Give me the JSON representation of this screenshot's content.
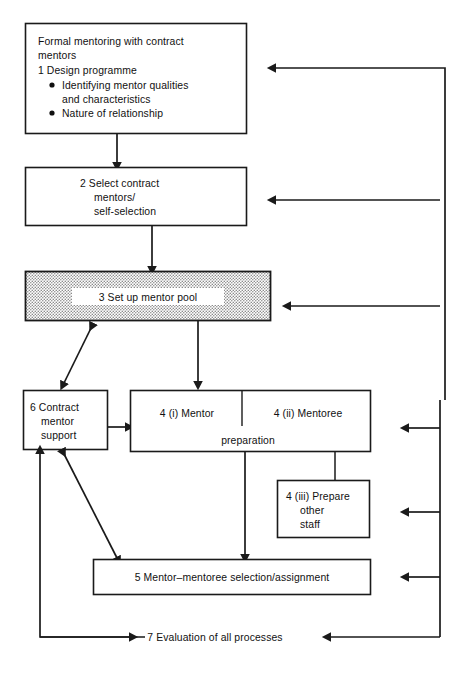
{
  "diagram": {
    "type": "flowchart",
    "title": "Formal mentoring with contract mentors",
    "orientation": "top-to-bottom with feedback loops",
    "background_color": "#ffffff",
    "line_color": "#1a1a1a",
    "shaded_fill_color": "#c9c9c9",
    "nodes": {
      "box1": {
        "number": "1",
        "heading_line1": "Formal mentoring with contract",
        "heading_line2": "mentors",
        "step_label": "1  Design programme",
        "bullets": [
          {
            "line1": "Identifying mentor qualities",
            "line2": "and characteristics"
          },
          {
            "line1": "Nature of relationship",
            "line2": ""
          }
        ]
      },
      "box2": {
        "number": "2",
        "line1": "2  Select contract",
        "line2": "mentors/",
        "line3": "self-selection"
      },
      "box3": {
        "number": "3",
        "label": "3  Set up mentor pool",
        "shaded": true
      },
      "box4": {
        "left_label": "4  (i) Mentor",
        "right_label": "4  (ii) Mentoree",
        "shared_label": "preparation"
      },
      "box4iii": {
        "line1": "4  (iii) Prepare",
        "line2": "other",
        "line3": "staff"
      },
      "box5": {
        "number": "5",
        "label": "5  Mentor–mentoree selection/assignment"
      },
      "box6": {
        "number": "6",
        "line1": "6  Contract",
        "line2": "mentor",
        "line3": "support"
      },
      "item7": {
        "number": "7",
        "label": "7  Evaluation of all processes",
        "boxed": false
      }
    },
    "connectors": [
      {
        "from": "box1",
        "to": "box2",
        "style": "straight-down-arrow"
      },
      {
        "from": "box2",
        "to": "box3",
        "style": "straight-down-arrow"
      },
      {
        "from": "box3",
        "to": "box4",
        "style": "straight-down-arrow"
      },
      {
        "from": "box3",
        "to": "box6",
        "style": "double-headed-diagonal"
      },
      {
        "from": "box6",
        "to": "box4",
        "style": "right-arrow"
      },
      {
        "from": "box6",
        "to": "box5",
        "style": "double-headed-diagonal"
      },
      {
        "from": "box4",
        "to": "box5",
        "style": "straight-down-arrow"
      },
      {
        "from": "box4",
        "to": "box4iii",
        "style": "elbow-down"
      },
      {
        "from": "item7",
        "to": "box1",
        "style": "outer-feedback-rail-arrow"
      },
      {
        "from": "item7",
        "to": "box2",
        "style": "outer-feedback-rail-arrow"
      },
      {
        "from": "item7",
        "to": "box3",
        "style": "outer-feedback-rail-arrow"
      },
      {
        "from": "item7",
        "to": "box4",
        "style": "inner-feedback-rail-arrow"
      },
      {
        "from": "item7",
        "to": "box4iii",
        "style": "inner-feedback-rail-arrow"
      },
      {
        "from": "item7",
        "to": "box5",
        "style": "inner-feedback-rail-arrow"
      },
      {
        "from": "box6",
        "to": "item7",
        "style": "left-rail-elbow-arrow"
      },
      {
        "from": "rails",
        "to": "item7",
        "style": "right-arrow-into-text"
      }
    ]
  }
}
